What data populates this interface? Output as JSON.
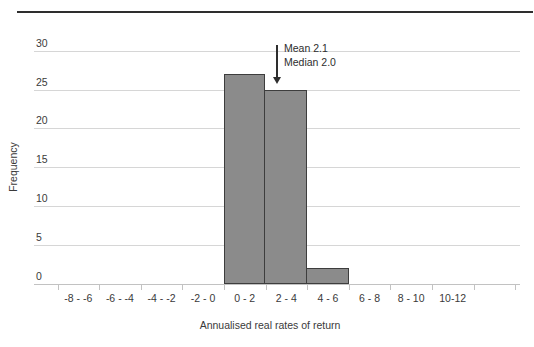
{
  "figure": {
    "top_rule_color": "#2e2e2e"
  },
  "chart_data": {
    "type": "bar",
    "title": "",
    "categories": [
      "-8 - -6",
      "-6 - -4",
      "-4 - -2",
      "-2 - 0",
      "0 - 2",
      "2 - 4",
      "4 - 6",
      "6 - 8",
      "8 - 10",
      "10-12"
    ],
    "values": [
      0,
      0,
      0,
      0,
      27,
      25,
      2,
      0,
      0,
      0
    ],
    "xlabel": "Annualised real rates of return",
    "ylabel": "Frequency",
    "ylim": [
      0,
      30
    ],
    "yticks": [
      0,
      5,
      10,
      15,
      20,
      25,
      30
    ],
    "grid": true,
    "legend_position": "none",
    "annotation": {
      "mean_label": "Mean 2.1",
      "median_label": "Median 2.0",
      "mean": 2.1,
      "median": 2.0
    },
    "colors": {
      "bar_fill": "#8b8b8b",
      "bar_border": "#3d3d3d",
      "gridline": "#d6d6d6",
      "axis_line": "#c2c2c2",
      "text": "#3a3a3a",
      "annotation": "#2e2e2e"
    }
  }
}
